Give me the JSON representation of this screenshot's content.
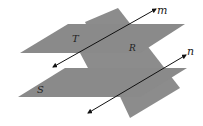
{
  "diagram": {
    "colors": {
      "plane_fill": "#8c8c8c",
      "line": "#111111",
      "background": "#ffffff"
    },
    "planes": [
      {
        "id": "T",
        "label": "T"
      },
      {
        "id": "R",
        "label": "R"
      },
      {
        "id": "S",
        "label": "S"
      }
    ],
    "lines": [
      {
        "id": "m",
        "label": "m"
      },
      {
        "id": "n",
        "label": "n"
      }
    ]
  }
}
